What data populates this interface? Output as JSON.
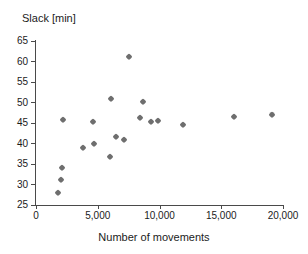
{
  "chart_data": {
    "type": "scatter",
    "title": "",
    "ylabel": "Slack [min]",
    "xlabel": "Number of movements",
    "xlim": [
      0,
      20000
    ],
    "ylim": [
      25,
      65
    ],
    "grid": false,
    "legend": null,
    "xticks": [
      0,
      5000,
      10000,
      15000,
      20000
    ],
    "xtick_labels": [
      "0",
      "5,000",
      "10,000",
      "15,000",
      "20,000"
    ],
    "yticks": [
      25,
      30,
      35,
      40,
      45,
      50,
      55,
      60,
      65
    ],
    "ytick_labels": [
      "25",
      "30",
      "35",
      "40",
      "45",
      "50",
      "55",
      "60",
      "65"
    ],
    "marker": "diamond",
    "marker_color": "#6e6e6e",
    "points": [
      {
        "x": 1800,
        "y": 28.0
      },
      {
        "x": 2000,
        "y": 31.0
      },
      {
        "x": 2100,
        "y": 34.0
      },
      {
        "x": 2200,
        "y": 45.8
      },
      {
        "x": 3800,
        "y": 38.8
      },
      {
        "x": 4600,
        "y": 45.3
      },
      {
        "x": 4700,
        "y": 40.0
      },
      {
        "x": 6000,
        "y": 36.7
      },
      {
        "x": 6100,
        "y": 50.9
      },
      {
        "x": 6500,
        "y": 41.7
      },
      {
        "x": 7100,
        "y": 40.8
      },
      {
        "x": 7500,
        "y": 61.0
      },
      {
        "x": 8400,
        "y": 46.2
      },
      {
        "x": 8700,
        "y": 50.2
      },
      {
        "x": 9300,
        "y": 45.3
      },
      {
        "x": 9900,
        "y": 45.5
      },
      {
        "x": 11900,
        "y": 44.5
      },
      {
        "x": 16000,
        "y": 46.4
      },
      {
        "x": 19100,
        "y": 47.0
      }
    ]
  }
}
